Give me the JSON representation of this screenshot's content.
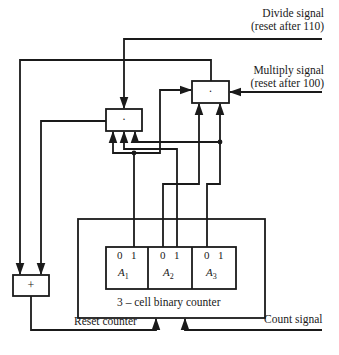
{
  "diagram": {
    "type": "logic-circuit",
    "signals": {
      "divide": {
        "line1": "Divide signal",
        "line2": "(reset after 110)"
      },
      "multiply": {
        "line1": "Multiply signal",
        "line2": "(reset after 100)"
      },
      "count": "Count signal",
      "reset": "Reset counter"
    },
    "gates": {
      "and_divide": {
        "symbol": "·"
      },
      "and_multiply": {
        "symbol": "·"
      },
      "or_reset": {
        "symbol": "+"
      }
    },
    "counter": {
      "label": "3 – cell binary counter",
      "cells": [
        {
          "name": "A",
          "sub": "1",
          "bit0": "0",
          "bit1": "1"
        },
        {
          "name": "A",
          "sub": "2",
          "bit0": "0",
          "bit1": "1"
        },
        {
          "name": "A",
          "sub": "3",
          "bit0": "0",
          "bit1": "1"
        }
      ]
    },
    "colors": {
      "line": "#1a1a1a",
      "background": "#ffffff"
    }
  }
}
